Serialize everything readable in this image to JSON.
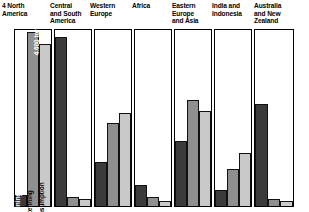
{
  "figure": {
    "number": "4",
    "annotation": "4,600 tonnes"
  },
  "series_labels": {
    "mining": "Mining",
    "refining": "Refining",
    "consumption": "Consumption"
  },
  "colors": {
    "mining": "#3b3b3b",
    "refining": "#8f8f8f",
    "consumption": "#c9c9c9",
    "panel_border": "#000000",
    "background": "#ffffff"
  },
  "panels": [
    {
      "title": "North America",
      "title_lines": [
        "North",
        "America"
      ],
      "has_figure_number": true,
      "has_series_labels": true,
      "annotated_bar": "refining",
      "values": {
        "mining": 6,
        "refining": 99,
        "consumption": 92
      }
    },
    {
      "title": "Central and South America",
      "title_lines": [
        "Central",
        "and South",
        "America"
      ],
      "has_figure_number": false,
      "has_series_labels": false,
      "annotated_bar": null,
      "values": {
        "mining": 96,
        "refining": 5,
        "consumption": 4
      }
    },
    {
      "title": "Western Europe",
      "title_lines": [
        "Western",
        "Europe"
      ],
      "has_figure_number": false,
      "has_series_labels": false,
      "annotated_bar": null,
      "values": {
        "mining": 25,
        "refining": 47,
        "consumption": 53
      }
    },
    {
      "title": "Africa",
      "title_lines": [
        "Africa"
      ],
      "has_figure_number": false,
      "has_series_labels": false,
      "annotated_bar": null,
      "values": {
        "mining": 12,
        "refining": 5,
        "consumption": 3
      }
    },
    {
      "title": "Eastern Europe and Asia",
      "title_lines": [
        "Eastern",
        "Europe",
        "and Asia"
      ],
      "has_figure_number": false,
      "has_series_labels": false,
      "annotated_bar": null,
      "values": {
        "mining": 37,
        "refining": 60,
        "consumption": 54
      }
    },
    {
      "title": "India and Indonesia",
      "title_lines": [
        "India and",
        "Indonesia"
      ],
      "has_figure_number": false,
      "has_series_labels": false,
      "annotated_bar": null,
      "values": {
        "mining": 9,
        "refining": 21,
        "consumption": 30
      }
    },
    {
      "title": "Australia and New Zealand",
      "title_lines": [
        "Australia",
        "and New",
        "Zealand"
      ],
      "has_figure_number": false,
      "has_series_labels": false,
      "annotated_bar": null,
      "values": {
        "mining": 58,
        "refining": 4,
        "consumption": 3
      }
    }
  ],
  "chart_data": {
    "type": "bar",
    "title": "",
    "subtitle": "",
    "xlabel": "",
    "ylabel": "",
    "annotations": [
      "4,600 tonnes"
    ],
    "legend_position": "in-panel (rotated bar labels on first panel)",
    "grid": false,
    "ylim": [
      0,
      100
    ],
    "units": "tonnes",
    "categories": [
      "North America",
      "Central and South America",
      "Western Europe",
      "Africa",
      "Eastern Europe and Asia",
      "India and Indonesia",
      "Australia and New Zealand"
    ],
    "series": [
      {
        "name": "Mining",
        "values": [
          6,
          96,
          25,
          12,
          37,
          9,
          58
        ]
      },
      {
        "name": "Refining",
        "values": [
          99,
          5,
          47,
          5,
          60,
          21,
          4
        ]
      },
      {
        "name": "Consumption",
        "values": [
          92,
          4,
          53,
          3,
          54,
          30,
          3
        ]
      }
    ]
  }
}
